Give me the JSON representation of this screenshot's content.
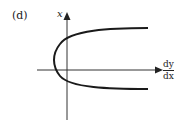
{
  "panel_label": "(d)",
  "axes": {
    "vertical_label": "x",
    "horizontal_label_numerator": "dy",
    "horizontal_label_denominator": "dx"
  },
  "curve": {
    "description": "sideways parabola opening to the right",
    "color": "#1a1a1a"
  }
}
